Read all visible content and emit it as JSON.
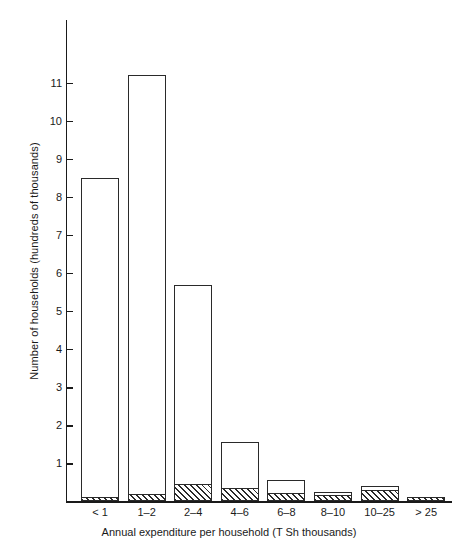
{
  "chart_data": {
    "type": "bar",
    "subtype": "stacked-histogram",
    "title": "",
    "xlabel": "Annual expenditure per household (T Sh thousands)",
    "ylabel": "Number of households (hundreds of thousands)",
    "categories": [
      "< 1",
      "1–2",
      "2–4",
      "4–6",
      "6–8",
      "8–10",
      "10–25",
      "> 25"
    ],
    "series": [
      {
        "name": "hatched",
        "fill": "diagonal-hatch",
        "values": [
          0.1,
          0.2,
          0.45,
          0.35,
          0.22,
          0.18,
          0.3,
          0.1
        ]
      },
      {
        "name": "open",
        "fill": "white",
        "values": [
          8.4,
          11.0,
          5.25,
          1.2,
          0.33,
          0.07,
          0.1,
          0.02
        ]
      }
    ],
    "totals": [
      8.5,
      11.2,
      5.7,
      1.55,
      0.55,
      0.25,
      0.4,
      0.12
    ],
    "yticks": [
      1,
      2,
      3,
      4,
      5,
      6,
      7,
      8,
      9,
      10,
      11
    ],
    "ylim": [
      0,
      11.85
    ],
    "grid": false,
    "legend": "none"
  },
  "axis": {
    "color": "#1a1a1a"
  }
}
